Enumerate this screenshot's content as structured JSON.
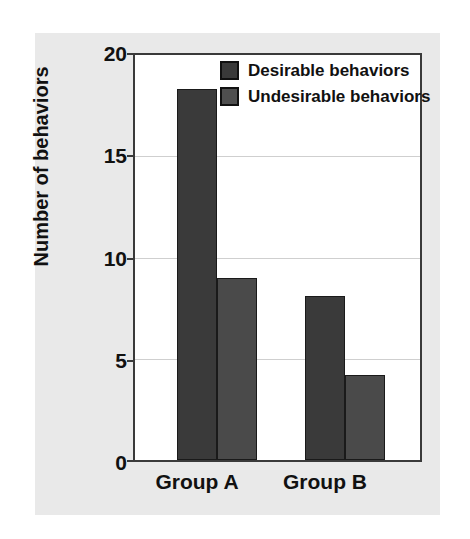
{
  "chart_data": {
    "type": "bar",
    "title": "",
    "subtitle": "",
    "xlabel": "",
    "ylabel": "Number of behaviors",
    "categories": [
      "Group A",
      "Group B"
    ],
    "series": [
      {
        "name": "Desirable behaviors",
        "values": [
          18.3,
          8.1
        ],
        "color": "#3a3a3a"
      },
      {
        "name": "Undesirable behaviors",
        "values": [
          9.0,
          4.2
        ],
        "color": "#4a4a4a"
      }
    ],
    "ylim": [
      0,
      20
    ],
    "yticks": [
      0,
      5,
      10,
      15,
      20
    ],
    "ytick_labels": [
      "0",
      "5",
      "10",
      "15",
      "20"
    ],
    "grid": true,
    "grid_axis": "y",
    "legend_position": "top-right",
    "legend": [
      "Desirable behaviors",
      "Undesirable behaviors"
    ],
    "annotations": []
  },
  "axis": {
    "y_title": "Number of behaviors",
    "tick_0": "0",
    "tick_5": "5",
    "tick_10": "10",
    "tick_15": "15",
    "tick_20": "20"
  },
  "categories": {
    "group_a": "Group A",
    "group_b": "Group B"
  },
  "legend": {
    "item_0_label": "Desirable behaviors",
    "item_1_label": "Undesirable behaviors"
  },
  "colors": {
    "bar_desirable": "#3a3a3a",
    "bar_undesirable": "#4a4a4a",
    "panel_background": "#e9e9e9",
    "plot_background": "#ffffff",
    "axis_line": "#3a3a3a",
    "gridline": "#cfcfcf",
    "text": "#111111"
  }
}
